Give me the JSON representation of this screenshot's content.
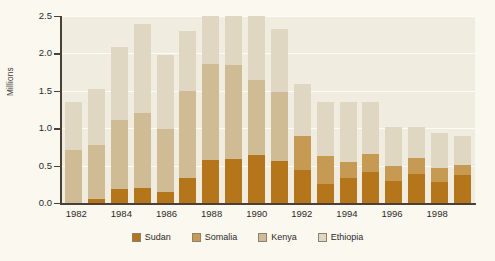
{
  "chart_data": {
    "type": "bar",
    "barmode": "stacked",
    "title": "",
    "xlabel": "",
    "ylabel": "Millions",
    "ylim": [
      0.0,
      2.5
    ],
    "ytick_labels": [
      "0.0",
      "0.5",
      "1.0",
      "1.5",
      "2.0",
      "2.5"
    ],
    "ytick_values": [
      0.0,
      0.5,
      1.0,
      1.5,
      2.0,
      2.5
    ],
    "grid": true,
    "grid_axis": "y",
    "legend_position": "bottom",
    "categories": [
      "1982",
      "1983",
      "1984",
      "1985",
      "1986",
      "1987",
      "1988",
      "1989",
      "1990",
      "1991",
      "1992",
      "1993",
      "1994",
      "1995",
      "1996",
      "1997",
      "1998",
      "1999"
    ],
    "xtick_labels": [
      "1982",
      "1984",
      "1986",
      "1988",
      "1990",
      "1992",
      "1994",
      "1996",
      "1998"
    ],
    "series": [
      {
        "name": "Sudan",
        "color": "#b5761b",
        "values": [
          0.0,
          0.06,
          0.19,
          0.2,
          0.15,
          0.33,
          0.68,
          0.71,
          0.8,
          0.56,
          0.44,
          0.25,
          0.33,
          0.41,
          0.29,
          0.39,
          0.28,
          0.38
        ]
      },
      {
        "name": "Somalia",
        "color": "#c69a52",
        "values": [
          0.0,
          0.0,
          0.0,
          0.0,
          0.0,
          0.0,
          0.0,
          0.0,
          0.0,
          0.0,
          0.45,
          0.38,
          0.22,
          0.24,
          0.21,
          0.21,
          0.19,
          0.13
        ]
      },
      {
        "name": "Kenya",
        "color": "#cfbc95",
        "values": [
          0.71,
          0.72,
          0.92,
          1.01,
          0.84,
          1.17,
          1.54,
          1.51,
          1.24,
          0.92,
          0.0,
          0.0,
          0.0,
          0.0,
          0.0,
          0.0,
          0.0,
          0.0
        ]
      },
      {
        "name": "Ethiopia",
        "color": "#e0d7c3",
        "values": [
          0.64,
          0.74,
          0.98,
          1.19,
          0.99,
          0.8,
          0.76,
          0.79,
          1.06,
          0.85,
          0.7,
          0.72,
          0.8,
          0.7,
          0.52,
          0.41,
          0.46,
          0.39
        ]
      }
    ],
    "totals": [
      1.35,
      1.46,
      1.9,
      2.2,
      1.83,
      1.97,
      2.3,
      2.3,
      2.3,
      1.41,
      1.59,
      1.35,
      1.35,
      1.35,
      1.02,
      1.01,
      0.93,
      0.9
    ],
    "colors": {
      "plot_background": "#f1ece0",
      "figure_background": "#fbf8f0",
      "gridline": "#fdfbf6",
      "axis": "#4a4038",
      "text": "#2e2a26"
    }
  },
  "legend": {
    "items": [
      {
        "label": "Sudan",
        "color": "#b5761b"
      },
      {
        "label": "Somalia",
        "color": "#c69a52"
      },
      {
        "label": "Kenya",
        "color": "#cfbc95"
      },
      {
        "label": "Ethiopia",
        "color": "#e0d7c3"
      }
    ]
  }
}
